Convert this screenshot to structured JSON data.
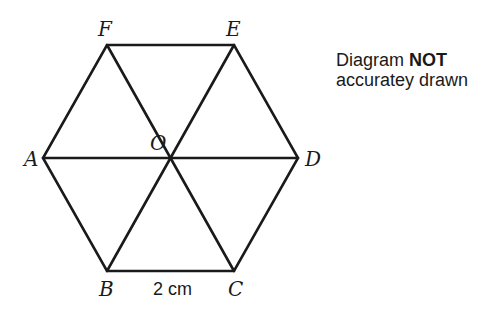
{
  "diagram": {
    "vertices": {
      "A": {
        "label": "A",
        "x": 43,
        "y": 158
      },
      "B": {
        "label": "B",
        "x": 107,
        "y": 271
      },
      "C": {
        "label": "C",
        "x": 234,
        "y": 271
      },
      "D": {
        "label": "D",
        "x": 298,
        "y": 158
      },
      "E": {
        "label": "E",
        "x": 234,
        "y": 45
      },
      "F": {
        "label": "F",
        "x": 107,
        "y": 45
      },
      "O": {
        "label": "O",
        "x": 172,
        "y": 158
      }
    },
    "side_label": "2 cm",
    "note": {
      "line1_prefix": "Diagram ",
      "line1_bold": "NOT",
      "line2": "accuratey drawn"
    }
  }
}
